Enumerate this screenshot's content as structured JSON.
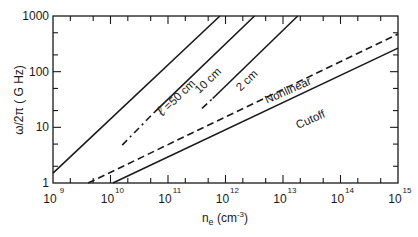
{
  "chart_data": {
    "type": "line",
    "title": "",
    "xlabel": "n_e (cm^-3)",
    "xlabel_parts": {
      "base": "n",
      "sub": "e",
      "unit_open": " (cm",
      "unit_sup": "-3",
      "unit_close": ")"
    },
    "ylabel": "ω/2π ( G Hz)",
    "xscale": "log",
    "yscale": "log",
    "xlim": [
      1000000000.0,
      1000000000000000.0
    ],
    "ylim": [
      1,
      1000
    ],
    "grid": false,
    "legend": "none (inline labels)",
    "x_ticks": [
      {
        "value": 1000000000.0,
        "base": "10",
        "exp": "9"
      },
      {
        "value": 10000000000.0,
        "base": "10",
        "exp": "10"
      },
      {
        "value": 100000000000.0,
        "base": "10",
        "exp": "11"
      },
      {
        "value": 1000000000000.0,
        "base": "10",
        "exp": "12"
      },
      {
        "value": 10000000000000.0,
        "base": "10",
        "exp": "13"
      },
      {
        "value": 100000000000000.0,
        "base": "10",
        "exp": "14"
      },
      {
        "value": 1000000000000000.0,
        "base": "10",
        "exp": "15"
      }
    ],
    "y_ticks": [
      {
        "value": 1,
        "label": "1"
      },
      {
        "value": 10,
        "label": "10"
      },
      {
        "value": 100,
        "label": "100"
      },
      {
        "value": 1000,
        "label": "1000"
      }
    ],
    "minor_ticks": [
      2,
      5
    ],
    "series": [
      {
        "name": "ℓ =50 cm",
        "label": "ℓ =50 cm",
        "style": "solid",
        "segments": [
          {
            "style": "solid",
            "points": [
              [
                1000000000.0,
                1.5
              ],
              [
                800000000000.0,
                1000
              ]
            ]
          }
        ],
        "label_pos": [
          155000000000.0,
          30
        ],
        "label_angle": -44
      },
      {
        "name": "10 cm",
        "label": "10 cm",
        "style": "dash-dot then solid",
        "segments": [
          {
            "style": "dashdot",
            "points": [
              [
                16000000000.0,
                4.8
              ],
              [
                59000000000.0,
                19
              ]
            ]
          },
          {
            "style": "solid",
            "points": [
              [
                59000000000.0,
                19
              ],
              [
                3200000000000.0,
                1000
              ]
            ]
          }
        ],
        "label_pos": [
          550000000000.0,
          62
        ],
        "label_angle": -44
      },
      {
        "name": "2 cm",
        "label": "2 cm",
        "style": "dash-dot then solid",
        "segments": [
          {
            "style": "dashdot",
            "points": [
              [
                390000000000.0,
                22
              ],
              [
                600000000000.0,
                33
              ]
            ]
          },
          {
            "style": "solid",
            "points": [
              [
                600000000000.0,
                33
              ],
              [
                18000000000000.0,
                1000
              ]
            ]
          }
        ],
        "label_pos": [
          2600000000000.0,
          62
        ],
        "label_angle": -44
      },
      {
        "name": "Nonlinear",
        "label": "Nonlinear",
        "style": "dashed",
        "segments": [
          {
            "style": "dashed",
            "points": [
              [
                4100000000.0,
                1
              ],
              [
                1000000000000000.0,
                475
              ]
            ]
          }
        ],
        "label_pos": [
          13000000000000.0,
          40
        ],
        "label_angle": -24
      },
      {
        "name": "Cutoff",
        "label": "Cutoff",
        "style": "solid",
        "segments": [
          {
            "style": "solid",
            "points": [
              [
                11000000000.0,
                1
              ],
              [
                1000000000000000.0,
                265
              ]
            ]
          }
        ],
        "label_pos": [
          32000000000000.0,
          12
        ],
        "label_angle": -24
      }
    ]
  }
}
